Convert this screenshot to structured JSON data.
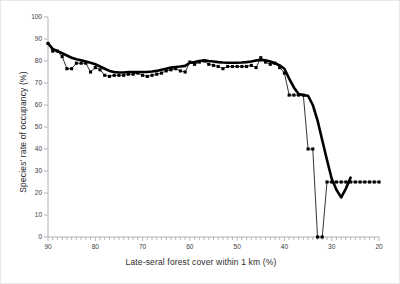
{
  "figure": {
    "background": "#ffffff",
    "border_color": "#e8e8e8",
    "ink_color": "#000000",
    "axis_color": "#b4b4b4",
    "label_color": "#3a3a3a"
  },
  "axes": {
    "x_title": "Late-seral forest cover within 1 km (%)",
    "y_title": "Species' rate of occupancy (%)",
    "x_tick_labels": [
      "90",
      "80",
      "70",
      "60",
      "50",
      "40",
      "30",
      "20"
    ],
    "y_tick_labels": [
      "0",
      "10",
      "20",
      "30",
      "40",
      "50",
      "60",
      "70",
      "80",
      "90",
      "100"
    ]
  },
  "chart_data": {
    "type": "line",
    "title": "",
    "xlabel": "Late-seral forest cover within 1 km (%)",
    "ylabel": "Species' rate of occupancy (%)",
    "xlim": [
      90,
      20
    ],
    "ylim": [
      0,
      100
    ],
    "x_reversed": true,
    "x_major_ticks": [
      90,
      80,
      70,
      60,
      50,
      40,
      30,
      20
    ],
    "x_minor_tick_step": 1,
    "y_major_ticks": [
      0,
      10,
      20,
      30,
      40,
      50,
      60,
      70,
      80,
      90,
      100
    ],
    "grid": false,
    "legend": false,
    "series": [
      {
        "name": "Observed occupancy rate",
        "style": "thin-line-with-square-markers",
        "marker": "square",
        "x": [
          90,
          89,
          88,
          87,
          86,
          85,
          84,
          83,
          82,
          81,
          80,
          79,
          78,
          77,
          76,
          75,
          74,
          73,
          72,
          71,
          70,
          69,
          68,
          67,
          66,
          65,
          64,
          63,
          62,
          61,
          60,
          59,
          58,
          57,
          56,
          55,
          54,
          53,
          52,
          51,
          50,
          49,
          48,
          47,
          46,
          45,
          44,
          43,
          42,
          41,
          40,
          39,
          38,
          37,
          36,
          35,
          34,
          33,
          32,
          31,
          30,
          29,
          28,
          27,
          26,
          25,
          24,
          23,
          22,
          21,
          20
        ],
        "values": [
          88,
          84.5,
          84.5,
          82,
          76.5,
          76.5,
          79,
          79,
          79,
          75,
          77,
          76,
          73.5,
          73,
          73.5,
          73.5,
          73.5,
          74,
          74,
          74.5,
          73.5,
          73,
          73.5,
          74,
          74.5,
          75.5,
          76,
          76.5,
          75.5,
          75,
          79.5,
          78.5,
          79.5,
          80,
          78.5,
          78,
          77.5,
          76.5,
          77.5,
          77.5,
          77.5,
          77.5,
          77.5,
          78,
          77,
          81.5,
          79.5,
          78.5,
          79,
          77,
          74.5,
          64.5,
          64.5,
          64.5,
          64.5,
          40,
          40,
          0,
          0,
          25,
          25,
          25,
          25,
          25,
          25,
          25,
          25,
          25,
          25,
          25,
          25
        ]
      },
      {
        "name": "Smoothed trend",
        "style": "thick-line",
        "marker": "none",
        "x": [
          90,
          89,
          88,
          87,
          86,
          85,
          84,
          83,
          82,
          81,
          80,
          79,
          78,
          77,
          76,
          75,
          74,
          73,
          72,
          71,
          70,
          69,
          68,
          67,
          66,
          65,
          64,
          63,
          62,
          61,
          60,
          59,
          58,
          57,
          56,
          55,
          54,
          53,
          52,
          51,
          50,
          49,
          48,
          47,
          46,
          45,
          44,
          43,
          42,
          41,
          40,
          39,
          38,
          37,
          36,
          35,
          34,
          33,
          32,
          31,
          30,
          29,
          28,
          27,
          26
        ],
        "values": [
          88,
          85.5,
          84.5,
          83.5,
          82.5,
          81.5,
          80.8,
          80.3,
          79.8,
          79.2,
          78.5,
          77.5,
          76.5,
          75.5,
          75,
          74.8,
          74.8,
          75,
          75,
          75,
          75,
          75,
          75.2,
          75.5,
          76,
          76.5,
          77,
          77.3,
          77.5,
          77.8,
          79.2,
          79.5,
          80,
          80.3,
          80,
          79.8,
          79.5,
          79.3,
          79.2,
          79.2,
          79.2,
          79.3,
          79.5,
          79.8,
          80.2,
          80.5,
          80.3,
          79.8,
          79,
          78,
          76.5,
          72,
          68,
          65,
          64.5,
          64.2,
          60,
          53,
          44,
          35,
          26.5,
          21.5,
          18,
          22,
          27
        ]
      }
    ],
    "annotations": [
      {
        "text": "Occupancy collapses to 0% at 33% and 32% late-seral cover",
        "x": 33,
        "y": 0
      },
      {
        "text": "Plateau near 75-80% occupancy above 45% cover",
        "x": 65,
        "y": 77
      }
    ]
  }
}
